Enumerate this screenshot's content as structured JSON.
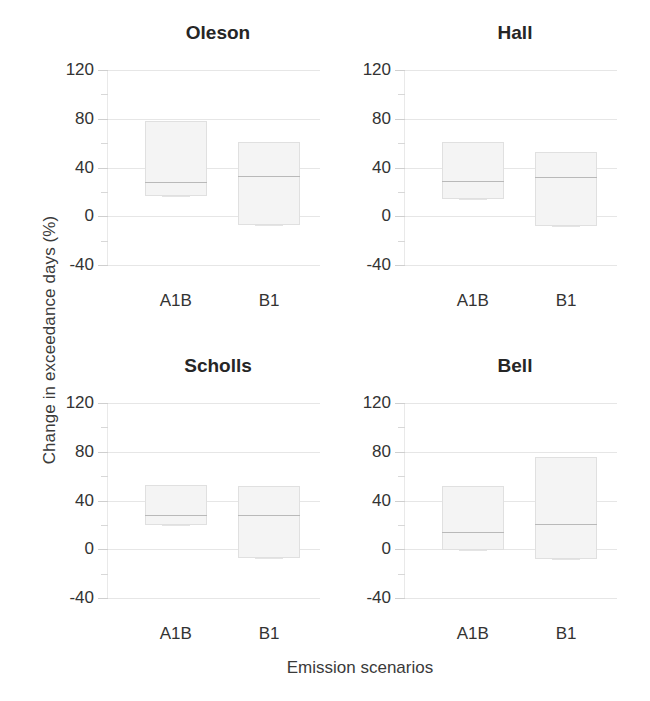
{
  "chart_data": {
    "type": "box",
    "title": "",
    "xlabel": "Emission scenarios",
    "ylabel": "Change in exceedance days (%)",
    "categories": [
      "A1B",
      "B1"
    ],
    "ylim": [
      -40,
      120
    ],
    "yticks": [
      -40,
      0,
      40,
      80,
      120
    ],
    "ytick_labels": [
      "-40",
      "0",
      "40",
      "80",
      "120"
    ],
    "minor_ticks": [
      -20,
      20,
      60,
      100
    ],
    "grid": true,
    "legend": "none",
    "panels": [
      {
        "name": "Oleson",
        "position": "top-left",
        "boxes": [
          {
            "category": "A1B",
            "q1": 17,
            "median": 28,
            "q3": 78,
            "whisker_low": 17,
            "whisker_high": 78
          },
          {
            "category": "B1",
            "q1": -7,
            "median": 33,
            "q3": 61,
            "whisker_low": -7,
            "whisker_high": 61
          }
        ]
      },
      {
        "name": "Hall",
        "position": "top-right",
        "boxes": [
          {
            "category": "A1B",
            "q1": 14,
            "median": 29,
            "q3": 61,
            "whisker_low": 14,
            "whisker_high": 61
          },
          {
            "category": "B1",
            "q1": -8,
            "median": 32,
            "q3": 53,
            "whisker_low": -8,
            "whisker_high": 53
          }
        ]
      },
      {
        "name": "Scholls",
        "position": "bottom-left",
        "boxes": [
          {
            "category": "A1B",
            "q1": 20,
            "median": 28,
            "q3": 53,
            "whisker_low": 20,
            "whisker_high": 53
          },
          {
            "category": "B1",
            "q1": -7,
            "median": 28,
            "q3": 52,
            "whisker_low": -7,
            "whisker_high": 52
          }
        ]
      },
      {
        "name": "Bell",
        "position": "bottom-right",
        "boxes": [
          {
            "category": "A1B",
            "q1": -1,
            "median": 14,
            "q3": 52,
            "whisker_low": -1,
            "whisker_high": 52
          },
          {
            "category": "B1",
            "q1": -8,
            "median": 21,
            "q3": 76,
            "whisker_low": -8,
            "whisker_high": 76
          }
        ]
      }
    ]
  },
  "axes": {
    "ylabel": "Change in exceedance days (%)",
    "xlabel": "Emission scenarios"
  },
  "panel_titles": {
    "oleson": "Oleson",
    "hall": "Hall",
    "scholls": "Scholls",
    "bell": "Bell"
  },
  "colors": {
    "box_fill": "#f4f4f4",
    "box_stroke": "#e0e0e0",
    "median": "#b9b9b9",
    "grid": "#ededed",
    "text": "#333333",
    "title": "#262626",
    "background": "#ffffff"
  }
}
